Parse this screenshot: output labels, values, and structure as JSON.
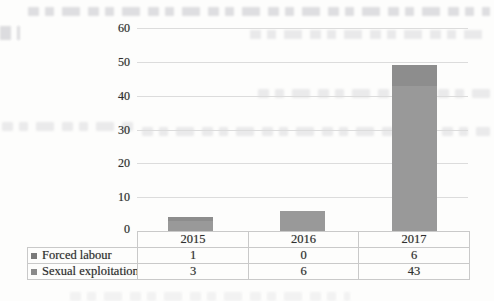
{
  "page": {
    "background": "#fdfdfc",
    "description_note": "scanned book page showing a stacked column chart with data table"
  },
  "chart_data": {
    "type": "bar",
    "subtype": "stacked-column",
    "title": "",
    "xlabel": "",
    "ylabel": "",
    "categories": [
      "2015",
      "2016",
      "2017"
    ],
    "series": [
      {
        "name": "Forced labour",
        "values": [
          1,
          0,
          6
        ],
        "color": "#8d8d8d",
        "legend_marker_color": "#7a7a7a",
        "stack_order": "top"
      },
      {
        "name": "Sexual exploitation",
        "values": [
          3,
          6,
          43
        ],
        "color": "#999999",
        "legend_marker_color": "#8a8a8a",
        "stack_order": "bottom"
      }
    ],
    "ylim": [
      0,
      60
    ],
    "yticks": [
      0,
      10,
      20,
      30,
      40,
      50,
      60
    ],
    "grid": true,
    "gridline_color": "#dcdcdc",
    "legend_position": "data-table-left",
    "data_table_shown": true
  },
  "data_table": {
    "columns": [
      "2015",
      "2016",
      "2017"
    ],
    "rows": [
      {
        "label": "Forced labour",
        "values": [
          "1",
          "0",
          "6"
        ]
      },
      {
        "label": "Sexual exploitation",
        "values": [
          "3",
          "6",
          "43"
        ]
      }
    ],
    "border_color": "#c9c9c9"
  }
}
